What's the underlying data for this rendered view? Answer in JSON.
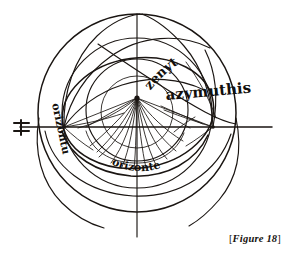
{
  "figure": {
    "caption_open_bracket": "[",
    "caption_text": "Figure 18",
    "caption_close_bracket": "]",
    "ink_color": "#1a1512",
    "background_color": "#ffffff"
  },
  "labels": {
    "zenith": "zenyth",
    "azimuth": "azymuthis",
    "horizon_left": "orizontu",
    "horizon_bottom": "orizonte"
  },
  "marks": {
    "left_cross": "dagger-cross-mark"
  },
  "geometry": {
    "center_x": 137,
    "center_y": 98,
    "outer_circle_radius": 99,
    "mid_circle_radius": 74,
    "inner_circle_radius": 51,
    "horizon_y": 127,
    "horizon_left_node_x": 64,
    "horizon_right_node_x": 213,
    "azimuth_ray_count": 17,
    "almucantar_count": 4
  }
}
